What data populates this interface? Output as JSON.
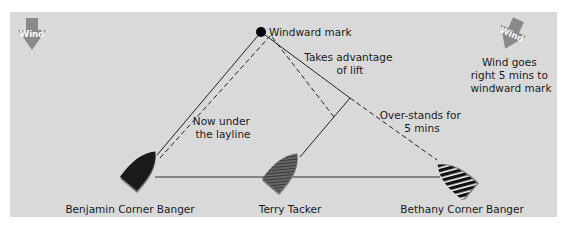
{
  "diagram": {
    "background_color": "#d9d9d9",
    "mark": {
      "label": "Windward mark"
    },
    "wind_left": {
      "label": "Wind",
      "icon": "wind-arrow-down-icon"
    },
    "wind_right": {
      "label": "Wind",
      "icon": "wind-arrow-rotated-icon",
      "note_lines": [
        "Wind goes",
        "right 5 mins to",
        "windward mark"
      ]
    },
    "annotations": {
      "lift": [
        "Takes advantage",
        "of lift"
      ],
      "layline": [
        "Now under",
        "the layline"
      ],
      "overstand": [
        "Over-stands for",
        "5 mins"
      ]
    },
    "boats": [
      {
        "name": "Benjamin Corner Banger",
        "fill": "#1a1a1a",
        "pattern": "solid"
      },
      {
        "name": "Terry Tacker",
        "fill": "#555555",
        "pattern": "fine-stripes"
      },
      {
        "name": "Bethany Corner Banger",
        "fill": "#111111",
        "pattern": "white-stripes"
      }
    ]
  }
}
